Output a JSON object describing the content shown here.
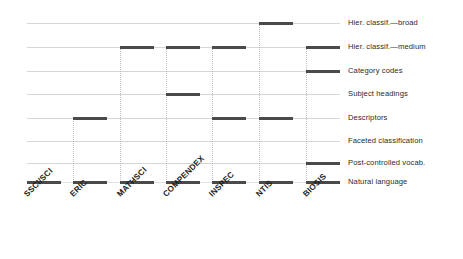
{
  "chart_data": {
    "type": "heatmap",
    "title": "",
    "subtitle": "",
    "xlabel": "",
    "ylabel": "",
    "legend": "none",
    "grid": true,
    "categories": [
      "SSCI/SCI",
      "ERIC",
      "MATHSCI",
      "COMPENDEX",
      "INSPEC",
      "NTIS",
      "BIOSIS"
    ],
    "rows": [
      "Hier. classif.—broad",
      "Hier. classif.—medium",
      "Category codes",
      "Subject headings",
      "Descriptors",
      "Faceted classification",
      "Post-controlled vocab.",
      "Natural language"
    ],
    "matrix": [
      [
        0,
        0,
        0,
        0,
        0,
        1,
        0
      ],
      [
        0,
        0,
        1,
        1,
        1,
        0,
        1
      ],
      [
        0,
        0,
        0,
        0,
        0,
        0,
        1
      ],
      [
        0,
        0,
        0,
        1,
        0,
        0,
        0
      ],
      [
        0,
        1,
        0,
        0,
        1,
        1,
        0
      ],
      [
        0,
        0,
        0,
        0,
        0,
        0,
        0
      ],
      [
        0,
        0,
        0,
        0,
        0,
        0,
        1
      ],
      [
        1,
        1,
        1,
        1,
        1,
        1,
        1
      ]
    ],
    "colors": {
      "mark": "#4a4a4a",
      "gridline": "#d7d7d7",
      "connector": "#bdbdbd",
      "text": "#1c1c1c",
      "background": "#ffffff"
    }
  },
  "rows": [
    {
      "label": "Hier. classif.—broad"
    },
    {
      "label": "Hier. classif.—medium"
    },
    {
      "label": "Category codes"
    },
    {
      "label": "Subject headings"
    },
    {
      "label": "Descriptors"
    },
    {
      "label": "Faceted classification"
    },
    {
      "label": "Post-controlled vocab."
    },
    {
      "label": "Natural language"
    }
  ],
  "categories": [
    {
      "label": "SSCI/SCI"
    },
    {
      "label": "ERIC"
    },
    {
      "label": "MATHSCI"
    },
    {
      "label": "COMPENDEX"
    },
    {
      "label": "INSPEC"
    },
    {
      "label": "NTIS"
    },
    {
      "label": "BIOSIS"
    }
  ]
}
